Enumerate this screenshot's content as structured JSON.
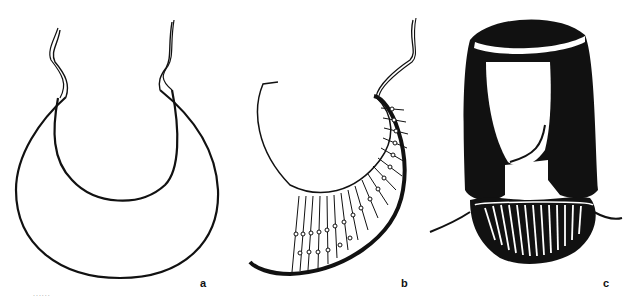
{
  "figure": {
    "panels": [
      {
        "id": "a",
        "label": "a",
        "description": "Crescent-shaped collar outline with tie strings"
      },
      {
        "id": "b",
        "label": "b",
        "description": "Half-worked collar showing bead strands"
      },
      {
        "id": "c",
        "label": "c",
        "description": "Figure with wig and headband wearing beaded collar"
      }
    ],
    "caption_fragment": "......",
    "colors": {
      "ink": "#111111",
      "paper": "#ffffff"
    }
  }
}
